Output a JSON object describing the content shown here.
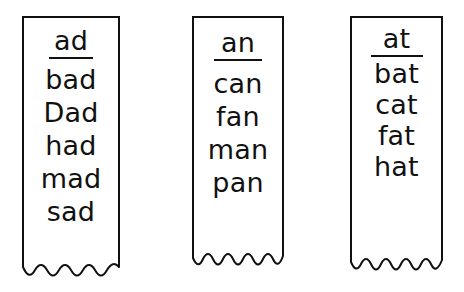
{
  "figure": {
    "kind": "word-family-chart",
    "background_color": "#ffffff",
    "ink_color": "#111111",
    "strip_count": 3
  },
  "columns": [
    {
      "id": "ad",
      "header": "ad",
      "header_underlined": true,
      "words": [
        "bad",
        "Dad",
        "had",
        "mad",
        "sad"
      ],
      "word_count": 5,
      "torn_edge": "wavy",
      "torn_wave_count": 4
    },
    {
      "id": "an",
      "header": "an",
      "header_underlined": true,
      "words": [
        "can",
        "fan",
        "man",
        "pan"
      ],
      "word_count": 4,
      "torn_edge": "wavy",
      "torn_wave_count": 5
    },
    {
      "id": "at",
      "header": "at",
      "header_underlined": true,
      "words": [
        "bat",
        "cat",
        "fat",
        "hat"
      ],
      "word_count": 4,
      "torn_edge": "wavy",
      "torn_wave_count": 5
    }
  ]
}
